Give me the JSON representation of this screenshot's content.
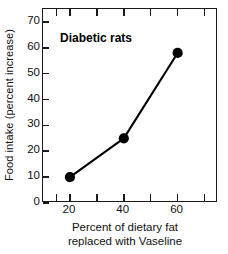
{
  "chart_data": {
    "type": "line",
    "title": "",
    "annotation": "Diabetic rats",
    "xlabel_line1": "Percent of dietary fat",
    "xlabel_line2": "replaced with Vaseline",
    "xlabel": "Percent of dietary fat replaced with Vaseline",
    "ylabel": "Food intake (percent increase)",
    "x": [
      20,
      40,
      60
    ],
    "values": [
      10,
      25,
      58
    ],
    "series": [
      {
        "name": "Diabetic rats",
        "values": [
          10,
          25,
          58
        ]
      }
    ],
    "xlim": [
      10,
      75
    ],
    "ylim": [
      0,
      75
    ],
    "xticks": [
      15,
      20,
      30,
      40,
      50,
      60,
      70
    ],
    "xtick_labels": [
      "20",
      "40",
      "60"
    ],
    "xtick_labeled_values": [
      20,
      40,
      60
    ],
    "yticks": [
      0,
      10,
      20,
      30,
      40,
      50,
      60,
      70
    ],
    "ytick_labels": [
      "0",
      "10",
      "20",
      "30",
      "40",
      "50",
      "60",
      "70"
    ],
    "grid": false,
    "legend": "none",
    "marker": "filled-circle",
    "marker_color": "#000000",
    "line_color": "#000000",
    "axis_color": "#1a1a1a",
    "background_color": "#ffffff"
  }
}
